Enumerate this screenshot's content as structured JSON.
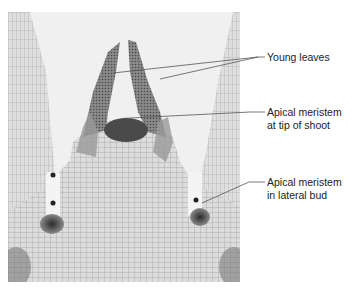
{
  "figure": {
    "type": "micrograph",
    "colors": {
      "background": "#ffffff",
      "tissue_light": "#d9d9d9",
      "tissue_mid": "#a8a8a8",
      "tissue_dark": "#3a3a3a",
      "leader_line": "#555555",
      "label_text": "#222222"
    },
    "labels": [
      {
        "id": "young-leaves",
        "lines": [
          "Young leaves"
        ]
      },
      {
        "id": "apical-meristem-tip",
        "lines": [
          "Apical meristem",
          "at tip of shoot"
        ]
      },
      {
        "id": "apical-meristem-lateral",
        "lines": [
          "Apical meristem",
          "in lateral bud"
        ]
      }
    ]
  }
}
